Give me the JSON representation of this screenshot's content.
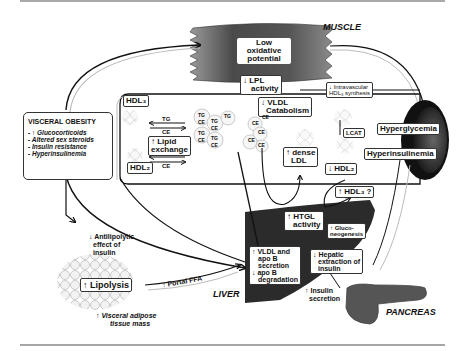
{
  "regions": {
    "muscle": "MUSCLE",
    "liver": "LIVER",
    "pancreas": "PANCREAS"
  },
  "muscle_box": [
    "Low",
    "oxidative",
    "potential"
  ],
  "lpl": [
    "↓ LPL",
    "activity"
  ],
  "intravascular": [
    "↓ Intravascular",
    "HDL₃ synthesis"
  ],
  "visceral_obesity": {
    "title": "VISCERAL OBESITY",
    "items": [
      "- ↑ Glucocorticoids",
      "- Altered sex steroids",
      "- Insulin resistance",
      "- Hyperinsulinemia"
    ]
  },
  "hdl3_top": "HDL₃",
  "hdl2_bottom": "HDL₂",
  "exchange_arrows": {
    "top_tg": "TG",
    "top_ce": "CE",
    "bottom_tg": "TG",
    "bottom_ce": "CE"
  },
  "lipid_exchange": [
    "↑ Lipid",
    "exchange"
  ],
  "vldl_particles": [
    "TG",
    "CE",
    "TG",
    "CE",
    "TG",
    "CE",
    "TG",
    "CE",
    "TG"
  ],
  "vldl_catabolism": [
    "↓ VLDL",
    "Catabolism"
  ],
  "ldl_particles": [
    "CE",
    "CE",
    "CE",
    "CE",
    "CE"
  ],
  "dense_ldl": [
    "↑ dense",
    "LDL"
  ],
  "lcat": "LCAT",
  "hdl2_right": "↓ HDL₂",
  "hdl3_q": "↑ HDL₃ ?",
  "hyperglycemia": "Hyperglycemia",
  "hyperinsulinemia": "Hyperinsulinemia",
  "htgl": [
    "↑ HTGL",
    "activity"
  ],
  "gluconeo": [
    "↑ Gluco-",
    "neogenesis"
  ],
  "vldl_secretion": [
    "↑ VLDL and",
    "apo B",
    "secretion",
    "↓ apo B",
    "degradation"
  ],
  "hepatic_extraction": [
    "↓ Hepatic",
    "extraction of",
    "insulin"
  ],
  "insulin_secretion": [
    "↑ Insulin",
    "secretion"
  ],
  "antilipolytic": [
    "↓ Antilipolytic",
    "effect of",
    "insulin"
  ],
  "lipolysis": "↑ Lipolysis",
  "portal_ffa": "↑ Portal FFA",
  "visceral_mass": [
    "↑ Visceral adipose",
    "tissue mass"
  ],
  "colors": {
    "organ_dark": "#2a2a2a",
    "muscle_gray": "#6b6b6b",
    "line": "#111111",
    "shadow": "#bbbbbb"
  }
}
